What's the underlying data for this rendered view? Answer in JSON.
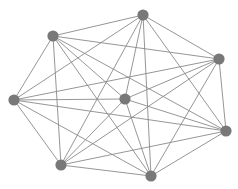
{
  "figure": {
    "kind": "network-graph",
    "width": 238,
    "height": 189,
    "background_color": "#ffffff"
  },
  "chart_data": {
    "type": "graph",
    "title": "",
    "subtitle": "",
    "xlabel": "",
    "ylabel": "",
    "grid": false,
    "legend": false,
    "axes_visible": false,
    "tick_labels": [],
    "annotations": [],
    "graph_kind": "complete-graph",
    "node_count": 8,
    "edge_count": 28,
    "directed": false,
    "weighted": false,
    "node_color": "#787878",
    "edge_color": "#8a8a8a",
    "node_radius": 5.6,
    "edge_width": 0.9,
    "node_labels_visible": false,
    "nodes": [
      {
        "id": "n0",
        "label": "",
        "x": 143,
        "y": 15
      },
      {
        "id": "n1",
        "label": "",
        "x": 53,
        "y": 36
      },
      {
        "id": "n2",
        "label": "",
        "x": 219,
        "y": 59
      },
      {
        "id": "n3",
        "label": "",
        "x": 14,
        "y": 100
      },
      {
        "id": "n4",
        "label": "",
        "x": 125,
        "y": 99
      },
      {
        "id": "n5",
        "label": "",
        "x": 226,
        "y": 131
      },
      {
        "id": "n6",
        "label": "",
        "x": 61,
        "y": 165
      },
      {
        "id": "n7",
        "label": "",
        "x": 151,
        "y": 176
      }
    ],
    "edges": [
      {
        "source": "n0",
        "target": "n1"
      },
      {
        "source": "n0",
        "target": "n2"
      },
      {
        "source": "n0",
        "target": "n3"
      },
      {
        "source": "n0",
        "target": "n4"
      },
      {
        "source": "n0",
        "target": "n5"
      },
      {
        "source": "n0",
        "target": "n6"
      },
      {
        "source": "n0",
        "target": "n7"
      },
      {
        "source": "n1",
        "target": "n2"
      },
      {
        "source": "n1",
        "target": "n3"
      },
      {
        "source": "n1",
        "target": "n4"
      },
      {
        "source": "n1",
        "target": "n5"
      },
      {
        "source": "n1",
        "target": "n6"
      },
      {
        "source": "n1",
        "target": "n7"
      },
      {
        "source": "n2",
        "target": "n3"
      },
      {
        "source": "n2",
        "target": "n4"
      },
      {
        "source": "n2",
        "target": "n5"
      },
      {
        "source": "n2",
        "target": "n6"
      },
      {
        "source": "n2",
        "target": "n7"
      },
      {
        "source": "n3",
        "target": "n4"
      },
      {
        "source": "n3",
        "target": "n5"
      },
      {
        "source": "n3",
        "target": "n6"
      },
      {
        "source": "n3",
        "target": "n7"
      },
      {
        "source": "n4",
        "target": "n5"
      },
      {
        "source": "n4",
        "target": "n6"
      },
      {
        "source": "n4",
        "target": "n7"
      },
      {
        "source": "n5",
        "target": "n6"
      },
      {
        "source": "n5",
        "target": "n7"
      },
      {
        "source": "n6",
        "target": "n7"
      }
    ]
  }
}
